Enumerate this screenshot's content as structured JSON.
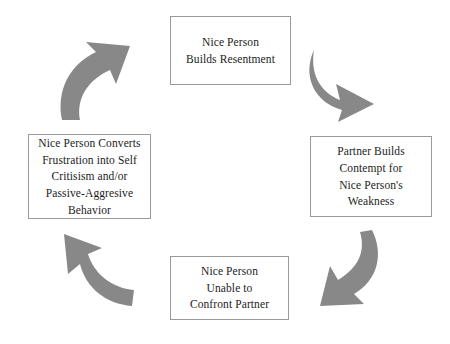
{
  "diagram": {
    "type": "cycle",
    "direction": "clockwise",
    "colors": {
      "box_border": "#9a9a9a",
      "box_fill": "#ffffff",
      "text": "#1c1c1c",
      "arrow_fill": "#888888",
      "background": "#ffffff"
    },
    "nodes": [
      {
        "id": "resentment",
        "position": "top",
        "label": "Nice Person\nBuilds Resentment"
      },
      {
        "id": "contempt",
        "position": "right",
        "label": "Partner Builds\nContempt for\nNice Person's\nWeakness"
      },
      {
        "id": "confront",
        "position": "bottom",
        "label": "Nice Person\nUnable to\nConfront Partner"
      },
      {
        "id": "converts",
        "position": "left",
        "label": "Nice Person Converts\nFrustration into Self\nCritisism and/or\nPassive-Aggresive\nBehavior"
      }
    ],
    "arrows": [
      {
        "id": "top-right",
        "from": "resentment",
        "to": "contempt",
        "name": "curved-arrow-top-right"
      },
      {
        "id": "bottom-right",
        "from": "contempt",
        "to": "confront",
        "name": "curved-arrow-bottom-right"
      },
      {
        "id": "bottom-left",
        "from": "confront",
        "to": "converts",
        "name": "curved-arrow-bottom-left"
      },
      {
        "id": "top-left",
        "from": "converts",
        "to": "resentment",
        "name": "curved-arrow-top-left"
      }
    ]
  }
}
